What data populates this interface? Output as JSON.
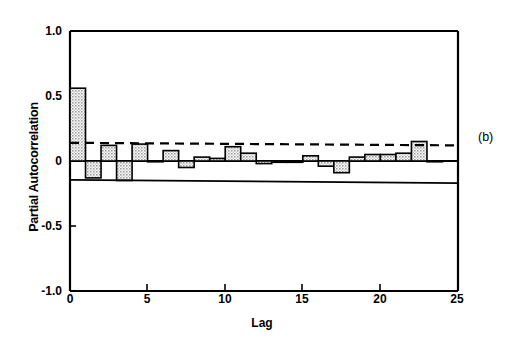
{
  "figure": {
    "panel_label": "(b)",
    "background_color": "#ffffff",
    "ink_color": "#000000",
    "bar_fill_color": "#b3b3b3"
  },
  "chart_data": {
    "type": "bar",
    "title": "",
    "xlabel": "Lag",
    "ylabel": "Partial Autocorrelation",
    "xlim": [
      0,
      25
    ],
    "ylim": [
      -1.0,
      1.0
    ],
    "grid": false,
    "legend": null,
    "xticks": [
      0,
      5,
      10,
      15,
      20,
      25
    ],
    "xtick_labels": [
      "0",
      "5",
      "10",
      "15",
      "20",
      "25"
    ],
    "yticks": [
      -1.0,
      -0.5,
      0,
      0.5,
      1.0
    ],
    "ytick_labels": [
      "-1.0",
      "-0.5",
      "0",
      "0.5",
      "1.0"
    ],
    "categories": [
      1,
      2,
      3,
      4,
      5,
      6,
      7,
      8,
      9,
      10,
      11,
      12,
      13,
      14,
      15,
      16,
      17,
      18,
      19,
      20,
      21,
      22,
      23,
      24
    ],
    "values": [
      0.56,
      -0.13,
      0.12,
      -0.15,
      0.13,
      0.0,
      0.08,
      -0.05,
      0.03,
      0.02,
      0.11,
      0.06,
      -0.02,
      -0.01,
      -0.01,
      0.04,
      -0.04,
      -0.09,
      0.03,
      0.05,
      0.05,
      0.06,
      0.15,
      0.0
    ],
    "annotations": [
      {
        "name": "upper-confidence-band",
        "style": "dashed",
        "y_start": 0.14,
        "y_end": 0.12
      },
      {
        "name": "lower-confidence-band",
        "style": "solid",
        "y_start": -0.145,
        "y_end": -0.17
      }
    ]
  }
}
